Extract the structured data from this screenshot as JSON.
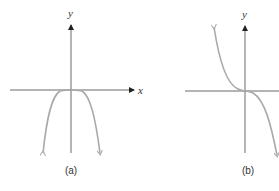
{
  "figure": {
    "top_text_fragment": "",
    "panels": [
      {
        "id": "a",
        "caption": "(a)",
        "x_axis_label": "x",
        "y_axis_label": "y",
        "description": "Even-degree polynomial with negative leading coefficient; flat near origin, both ends fall downward"
      },
      {
        "id": "b",
        "caption": "(b)",
        "x_axis_label": "x",
        "y_axis_label": "y",
        "description": "Odd-degree polynomial with negative leading coefficient; rises on the left, flat at origin, falls on the right"
      }
    ],
    "colors": {
      "axis": "#6a6a6a",
      "curve": "#a9a9a9",
      "text": "#333333",
      "background": "#ffffff"
    }
  }
}
